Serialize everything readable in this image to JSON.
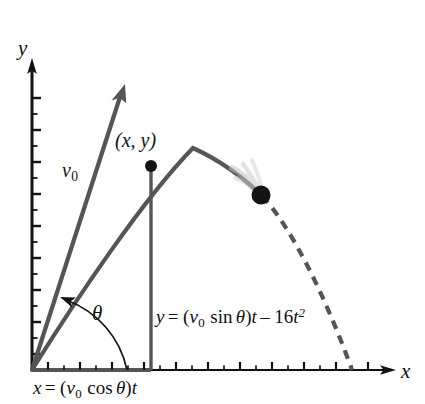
{
  "figure": {
    "type": "diagram",
    "background_color": "#ffffff"
  },
  "axes": {
    "x_label": "x",
    "y_label": "y",
    "origin": [
      32,
      370
    ],
    "x_axis_end": [
      392,
      370
    ],
    "y_axis_end": [
      32,
      62
    ],
    "tick_spacing_px": 16,
    "major_tick_len": 7,
    "minor_tick_len": 4,
    "axis_color": "#111111"
  },
  "labels": {
    "velocity_vector": {
      "base": "v",
      "subscript": "0"
    },
    "point": {
      "text": "(x, y)"
    },
    "angle": {
      "text": "θ"
    },
    "equation_y": {
      "lhs": "y",
      "eq": "=",
      "rhs_open": "(",
      "v": "v",
      "v_sub": "0",
      "trig": "sin",
      "theta": "θ",
      "rhs_close": ")",
      "t1": "t",
      "minus": "–",
      "coeff": "16",
      "t2": "t",
      "power": "2",
      "full": "y = (v0 sin θ)t – 16t2"
    },
    "equation_x": {
      "lhs": "x",
      "eq": "=",
      "rhs_open": "(",
      "v": "v",
      "v_sub": "0",
      "trig": "cos",
      "theta": "θ",
      "rhs_close": ")",
      "t1": "t",
      "full": "x = (v0 cos θ)t"
    }
  },
  "graphics": {
    "trajectory_color": "#555555",
    "trajectory_width": 4.2,
    "dashed_color": "#555555",
    "dash_pattern": "9 7",
    "vector_color": "#555555",
    "vector_width": 4.2,
    "drop_line_color": "#555555",
    "drop_line_width": 3.2,
    "ball_color": "#141414",
    "blur_color": "#bbbbbb",
    "arc_color": "#141414",
    "baseline_color": "#555555",
    "apex": [
      193,
      148
    ],
    "point_xy": [
      151,
      166
    ],
    "ball": [
      261,
      195
    ],
    "landing": [
      352,
      370
    ],
    "vector_tip": [
      125,
      88
    ],
    "angle_arc_radius": 95,
    "angle_degrees": 71
  }
}
